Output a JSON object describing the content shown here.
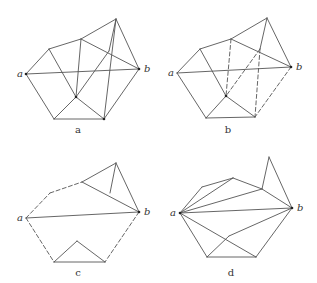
{
  "figure": {
    "panels": [
      {
        "id": "a",
        "caption": "a",
        "caption_pos": [
          78,
          133
        ],
        "vertices": {
          "a": [
            26,
            74
          ],
          "b": [
            139,
            69
          ],
          "p1": [
            49,
            49
          ],
          "p2": [
            81,
            39
          ],
          "p3": [
            116,
            19
          ],
          "p4": [
            109,
            51
          ],
          "p5": [
            76,
            97
          ],
          "bl": [
            54,
            119
          ],
          "br": [
            104,
            119
          ]
        },
        "labels": [
          {
            "text": "a",
            "vertex": "a",
            "dx": -9,
            "dy": 3
          },
          {
            "text": "b",
            "vertex": "b",
            "dx": 5,
            "dy": 3
          }
        ],
        "dots": [
          "a",
          "b",
          "p5",
          "br"
        ],
        "edges": [
          [
            "a",
            "p1",
            0
          ],
          [
            "p1",
            "p2",
            0
          ],
          [
            "p2",
            "p3",
            0
          ],
          [
            "p3",
            "b",
            0
          ],
          [
            "b",
            "br",
            0
          ],
          [
            "br",
            "bl",
            0
          ],
          [
            "bl",
            "a",
            0
          ],
          [
            "a",
            "b",
            0
          ],
          [
            "p1",
            "p5",
            0
          ],
          [
            "p2",
            "p5",
            0
          ],
          [
            "p2",
            "b",
            0
          ],
          [
            "p3",
            "br",
            0
          ],
          [
            "p4",
            "p5",
            0
          ],
          [
            "p3",
            "p4",
            0
          ],
          [
            "p5",
            "bl",
            0
          ],
          [
            "p5",
            "br",
            0
          ]
        ]
      },
      {
        "id": "b",
        "caption": "b",
        "caption_pos": [
          228,
          133
        ],
        "vertices": {
          "a": [
            177,
            73
          ],
          "b": [
            291,
            67
          ],
          "p1": [
            200,
            49
          ],
          "p2": [
            231,
            39
          ],
          "p3": [
            267,
            18
          ],
          "p4": [
            260,
            49
          ],
          "p5": [
            226,
            96
          ],
          "bl": [
            206,
            118
          ],
          "br": [
            255,
            117
          ]
        },
        "labels": [
          {
            "text": "a",
            "vertex": "a",
            "dx": -9,
            "dy": 3
          },
          {
            "text": "b",
            "vertex": "b",
            "dx": 5,
            "dy": 3
          }
        ],
        "dots": [
          "b",
          "p5"
        ],
        "edges": [
          [
            "a",
            "p1",
            0
          ],
          [
            "p1",
            "p2",
            0
          ],
          [
            "p2",
            "p3",
            0
          ],
          [
            "p3",
            "b",
            0
          ],
          [
            "b",
            "br",
            1
          ],
          [
            "br",
            "bl",
            0
          ],
          [
            "bl",
            "a",
            0
          ],
          [
            "a",
            "b",
            0
          ],
          [
            "p1",
            "p5",
            0
          ],
          [
            "p2",
            "p5",
            1
          ],
          [
            "p2",
            "b",
            0
          ],
          [
            "p3",
            "p4",
            0
          ],
          [
            "p4",
            "br",
            1
          ],
          [
            "p4",
            "p5",
            1
          ],
          [
            "p5",
            "bl",
            0
          ],
          [
            "p5",
            "br",
            0
          ]
        ]
      },
      {
        "id": "c",
        "caption": "c",
        "caption_pos": [
          78,
          276
        ],
        "vertices": {
          "a": [
            26,
            218
          ],
          "b": [
            139,
            212
          ],
          "p1": [
            50,
            193
          ],
          "p2": [
            82,
            182
          ],
          "p3": [
            116,
            163
          ],
          "p4": [
            110,
            193
          ],
          "mid": [
            77,
            241
          ],
          "bl": [
            54,
            262
          ],
          "br": [
            105,
            262
          ]
        },
        "labels": [
          {
            "text": "a",
            "vertex": "a",
            "dx": -9,
            "dy": 3
          },
          {
            "text": "b",
            "vertex": "b",
            "dx": 5,
            "dy": 3
          }
        ],
        "dots": [
          "b"
        ],
        "edges": [
          [
            "a",
            "p1",
            1
          ],
          [
            "p1",
            "p2",
            1
          ],
          [
            "p2",
            "p3",
            0
          ],
          [
            "p3",
            "b",
            0
          ],
          [
            "p2",
            "b",
            0
          ],
          [
            "p3",
            "p4",
            0
          ],
          [
            "a",
            "b",
            0
          ],
          [
            "a",
            "bl",
            1
          ],
          [
            "b",
            "br",
            1
          ],
          [
            "bl",
            "br",
            0
          ],
          [
            "bl",
            "mid",
            0
          ],
          [
            "mid",
            "br",
            0
          ]
        ]
      },
      {
        "id": "d",
        "caption": "d",
        "caption_pos": [
          231,
          276
        ],
        "vertices": {
          "a": [
            180,
            213
          ],
          "b": [
            292,
            208
          ],
          "p1": [
            202,
            187
          ],
          "p2": [
            233,
            178
          ],
          "p3": [
            269,
            157
          ],
          "p4": [
            262,
            189
          ],
          "p5": [
            229,
            236
          ],
          "bl": [
            207,
            257
          ],
          "br": [
            256,
            257
          ]
        },
        "labels": [
          {
            "text": "a",
            "vertex": "a",
            "dx": -10,
            "dy": 3
          },
          {
            "text": "b",
            "vertex": "b",
            "dx": 5,
            "dy": 3
          }
        ],
        "dots": [
          "a",
          "b"
        ],
        "edges": [
          [
            "a",
            "p1",
            0
          ],
          [
            "p1",
            "p2",
            0
          ],
          [
            "p2",
            "p4",
            0
          ],
          [
            "p4",
            "p3",
            0
          ],
          [
            "p3",
            "b",
            0
          ],
          [
            "p4",
            "b",
            0
          ],
          [
            "a",
            "p2",
            0
          ],
          [
            "a",
            "p4",
            0
          ],
          [
            "a",
            "b",
            0
          ],
          [
            "a",
            "br",
            0
          ],
          [
            "a",
            "bl",
            0
          ],
          [
            "bl",
            "br",
            0
          ],
          [
            "br",
            "b",
            0
          ],
          [
            "b",
            "p5",
            0
          ],
          [
            "p5",
            "bl",
            0
          ]
        ]
      }
    ]
  }
}
